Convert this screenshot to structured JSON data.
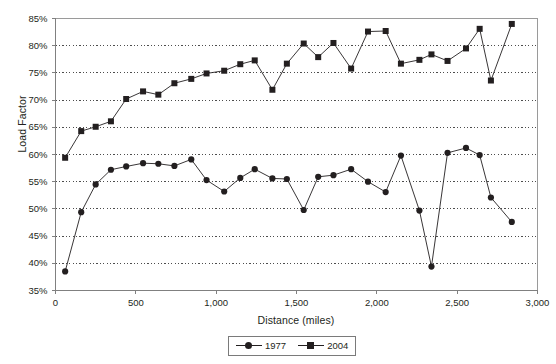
{
  "chart_data": {
    "type": "line",
    "title": "",
    "xlabel": "Distance (miles)",
    "ylabel": "Load Factor",
    "xlim": [
      0,
      3000
    ],
    "ylim": [
      35,
      85
    ],
    "xticks": [
      0,
      500,
      1000,
      1500,
      2000,
      2500,
      3000
    ],
    "xtick_labels": [
      "0",
      "500",
      "1,000",
      "1,500",
      "2,000",
      "2,500",
      "3,000"
    ],
    "yticks": [
      35,
      40,
      45,
      50,
      55,
      60,
      65,
      70,
      75,
      80,
      85
    ],
    "ytick_labels": [
      "35%",
      "40%",
      "45%",
      "50%",
      "55%",
      "60%",
      "65%",
      "70%",
      "75%",
      "80%",
      "85%"
    ],
    "grid": "horizontal-dotted",
    "legend_position": "bottom-center",
    "x": [
      60,
      160,
      250,
      345,
      440,
      545,
      640,
      740,
      845,
      940,
      1050,
      1150,
      1240,
      1350,
      1440,
      1545,
      1635,
      1730,
      1840,
      1945,
      2055,
      2150,
      2265,
      2340,
      2440,
      2555,
      2640,
      2710,
      2840
    ],
    "series": [
      {
        "name": "1977",
        "marker": "circle",
        "values": [
          38.5,
          49.4,
          54.5,
          57.2,
          57.8,
          58.4,
          58.3,
          57.9,
          59.1,
          55.3,
          53.2,
          55.7,
          57.3,
          55.6,
          55.5,
          49.8,
          55.9,
          56.2,
          57.3,
          55.0,
          53.1,
          59.8,
          49.7,
          39.4,
          60.3,
          61.2,
          59.9,
          52.1,
          47.6
        ]
      },
      {
        "name": "2004",
        "marker": "square",
        "values": [
          59.4,
          64.3,
          65.1,
          66.1,
          70.2,
          71.6,
          71.0,
          73.1,
          73.9,
          74.9,
          75.4,
          76.6,
          77.3,
          71.9,
          76.7,
          80.4,
          77.9,
          80.5,
          75.8,
          82.6,
          82.7,
          76.7,
          77.4,
          78.4,
          77.2,
          79.5,
          83.1,
          73.6,
          84.0
        ]
      }
    ],
    "legend": [
      {
        "label": "1977",
        "marker": "circle"
      },
      {
        "label": "2004",
        "marker": "square"
      }
    ],
    "colors": {
      "series": "#231f20",
      "grid": "#4d4d4d",
      "axis": "#808080",
      "background": "#ffffff"
    }
  }
}
